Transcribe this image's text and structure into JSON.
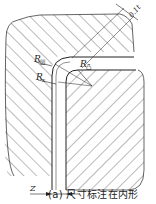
{
  "diagram": {
    "type": "bending-die-cross-section",
    "labels": {
      "r_die": "R",
      "r_die_sub": "凹",
      "r_punch": "R",
      "r_punch_sub": "凸",
      "r_x": "R",
      "r_x_sub": "x",
      "clearance_top": "0.1t",
      "gap": "Z"
    },
    "caption": "(a) 尺寸标注在内形",
    "colors": {
      "line": "#222222",
      "hatch": "#555555",
      "background": "#ffffff"
    }
  }
}
